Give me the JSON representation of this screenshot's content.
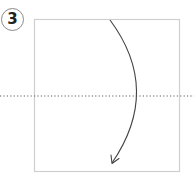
{
  "step": {
    "number": "3"
  },
  "diagram": {
    "paper_square": {
      "x": 34,
      "y": 19,
      "width": 145,
      "height": 152,
      "stroke": "#cfcfcf"
    },
    "fold_line": {
      "y": 96,
      "x1": 0,
      "x2": 194,
      "style": "dotted",
      "stroke": "#5a5a5a"
    },
    "fold_arrow": {
      "icon": "curved-arrow-down-icon",
      "start": [
        110,
        20
      ],
      "control": [
        160,
        90
      ],
      "end": [
        112,
        163
      ],
      "stroke": "#444444"
    }
  },
  "colors": {
    "badge_border": "#8a8a8a",
    "number": "#222222",
    "background": "#ffffff"
  }
}
